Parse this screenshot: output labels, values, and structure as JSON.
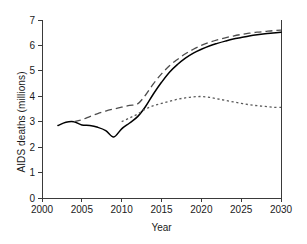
{
  "chart_data": {
    "type": "line",
    "title": "",
    "xlabel": "Year",
    "ylabel": "AIDS deaths (millions)",
    "xlim": [
      2000,
      2030
    ],
    "ylim": [
      0,
      7
    ],
    "xticks": [
      2000,
      2005,
      2010,
      2015,
      2020,
      2025,
      2030
    ],
    "xtick_labels": [
      "2000",
      "2005",
      "2010",
      "2015",
      "2020",
      "2025",
      "2030"
    ],
    "yticks": [
      0,
      1,
      2,
      3,
      4,
      5,
      6,
      7
    ],
    "ytick_labels": [
      "0",
      "1",
      "2",
      "3",
      "4",
      "5",
      "6",
      "7"
    ],
    "grid": false,
    "legend": "none",
    "series": [
      {
        "name": "solid-line",
        "style": "solid",
        "color": "#000000",
        "x": [
          2002,
          2003,
          2004,
          2005,
          2006,
          2007,
          2008,
          2009,
          2010,
          2011,
          2012,
          2013,
          2014,
          2015,
          2016,
          2017,
          2018,
          2019,
          2020,
          2021,
          2022,
          2023,
          2024,
          2025,
          2026,
          2027,
          2028,
          2029,
          2030
        ],
        "values": [
          2.85,
          2.98,
          3.0,
          2.87,
          2.85,
          2.78,
          2.65,
          2.4,
          2.72,
          2.95,
          3.2,
          3.6,
          4.1,
          4.55,
          4.95,
          5.25,
          5.5,
          5.7,
          5.85,
          5.98,
          6.08,
          6.17,
          6.25,
          6.31,
          6.37,
          6.42,
          6.46,
          6.49,
          6.52
        ]
      },
      {
        "name": "long-dashed-line",
        "style": "long-dashed",
        "color": "#4d4d4d",
        "x": [
          2004,
          2005,
          2006,
          2007,
          2008,
          2009,
          2010,
          2011,
          2012,
          2013,
          2014,
          2015,
          2016,
          2017,
          2018,
          2019,
          2020,
          2021,
          2022,
          2023,
          2024,
          2025,
          2026,
          2027,
          2028,
          2029,
          2030
        ],
        "values": [
          3.0,
          3.08,
          3.2,
          3.32,
          3.42,
          3.5,
          3.57,
          3.64,
          3.7,
          4.05,
          4.5,
          4.88,
          5.2,
          5.45,
          5.67,
          5.85,
          6.0,
          6.12,
          6.22,
          6.3,
          6.37,
          6.43,
          6.48,
          6.52,
          6.55,
          6.58,
          6.6
        ]
      },
      {
        "name": "dotted-line",
        "style": "dotted",
        "color": "#5a5a5a",
        "x": [
          2010,
          2011,
          2012,
          2013,
          2014,
          2015,
          2016,
          2017,
          2018,
          2019,
          2020,
          2021,
          2022,
          2023,
          2024,
          2025,
          2026,
          2027,
          2028,
          2029,
          2030
        ],
        "values": [
          3.0,
          3.15,
          3.3,
          3.5,
          3.63,
          3.72,
          3.8,
          3.88,
          3.94,
          3.98,
          3.99,
          3.96,
          3.9,
          3.84,
          3.78,
          3.72,
          3.67,
          3.63,
          3.6,
          3.57,
          3.56
        ]
      }
    ]
  }
}
